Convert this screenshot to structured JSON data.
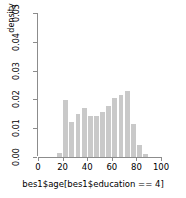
{
  "chart_data": {
    "type": "bar",
    "title": "",
    "xlabel": "bes1$age[bes1$education == 4]",
    "ylabel": "density",
    "xlim": [
      0,
      100
    ],
    "ylim": [
      0.0,
      0.05
    ],
    "xticks": [
      0,
      20,
      40,
      60,
      80,
      100
    ],
    "xtick_labels": [
      "0",
      "20",
      "40",
      "60",
      "80",
      "100"
    ],
    "yticks": [
      0.0,
      0.01,
      0.02,
      0.03,
      0.04,
      0.05
    ],
    "ytick_labels": [
      "0.00",
      "0.01",
      "0.02",
      "0.03",
      "0.04",
      "0.05"
    ],
    "grid": false,
    "legend": false,
    "bin_width": 5,
    "bar_color": "#c9c9c9",
    "axis_color": "#8c8c8c",
    "bins": [
      {
        "x0": 15,
        "x1": 20,
        "density": 0.0013
      },
      {
        "x0": 20,
        "x1": 25,
        "density": 0.0199
      },
      {
        "x0": 25,
        "x1": 30,
        "density": 0.0121
      },
      {
        "x0": 30,
        "x1": 35,
        "density": 0.0149
      },
      {
        "x0": 35,
        "x1": 40,
        "density": 0.017
      },
      {
        "x0": 40,
        "x1": 45,
        "density": 0.0144
      },
      {
        "x0": 45,
        "x1": 50,
        "density": 0.0144
      },
      {
        "x0": 50,
        "x1": 55,
        "density": 0.0155
      },
      {
        "x0": 55,
        "x1": 60,
        "density": 0.0176
      },
      {
        "x0": 60,
        "x1": 65,
        "density": 0.0204
      },
      {
        "x0": 65,
        "x1": 70,
        "density": 0.0217
      },
      {
        "x0": 70,
        "x1": 75,
        "density": 0.0229
      },
      {
        "x0": 75,
        "x1": 80,
        "density": 0.0113
      },
      {
        "x0": 80,
        "x1": 85,
        "density": 0.004
      },
      {
        "x0": 85,
        "x1": 90,
        "density": 0.0012
      }
    ]
  }
}
